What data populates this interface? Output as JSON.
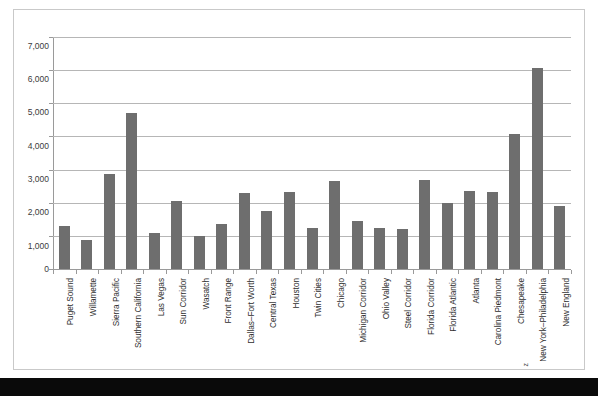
{
  "document": {
    "background_color": "#ffffff",
    "frame_border_color": "#c9c9c9",
    "footer_strip_color": "#0a0a0a"
  },
  "chart_data": {
    "type": "bar",
    "title": "",
    "subtitle": "",
    "xlabel": "",
    "ylabel": "",
    "ylim": [
      0,
      7000
    ],
    "ytick_labels": [
      "7,000",
      "6,000",
      "5,000",
      "4,000",
      "3,000",
      "2,000",
      "1,000",
      "0"
    ],
    "ytick_values": [
      7000,
      6000,
      5000,
      4000,
      3000,
      2000,
      1000,
      0
    ],
    "grid": true,
    "legend": "none",
    "bar_color": "#6e6e6e",
    "gridline_color": "#b6b6b6",
    "axis_color": "#9a9a9a",
    "categories": [
      "Puget Sound",
      "Willamette",
      "Sierra Pacific",
      "Southern California",
      "Las Vegas",
      "Sun Corridor",
      "Wasatch",
      "Front Range",
      "Dallas–Fort Worth",
      "Central Texas",
      "Houston",
      "Twin Cities",
      "Chicago",
      "Michigan Corridor",
      "Ohio Valley",
      "Steel Corridor",
      "Florida Corridor",
      "Florida Atlantic",
      "Atlanta",
      "Carolina Piedmont",
      "Chesapeake",
      "New York–Philadelphia",
      "New England"
    ],
    "values": [
      1300,
      880,
      2860,
      4700,
      1080,
      2060,
      990,
      1370,
      2300,
      1760,
      2320,
      1230,
      2660,
      1440,
      1250,
      1210,
      2680,
      1980,
      2340,
      2330,
      4060,
      6070,
      1900
    ]
  },
  "artifacts": {
    "page_mark": "z"
  }
}
